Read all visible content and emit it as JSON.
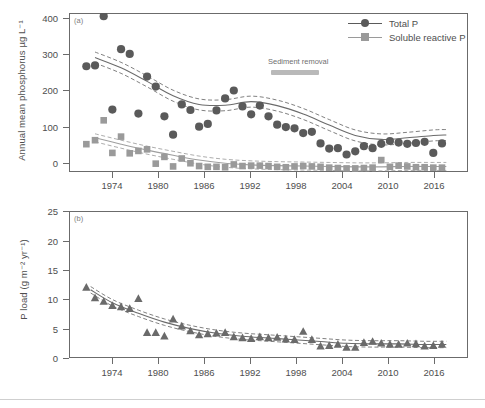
{
  "figure": {
    "background": "#ffffff",
    "total_p_color": "#5a5a5a",
    "srp_color": "#9a9a9a",
    "pload_color": "#6a6a6a",
    "axis_color": "#6b6b6b",
    "sediment_bar_color": "#b9b9b9"
  },
  "panel_a": {
    "tag": "(a)",
    "ylabel": "Annual mean phosphorus µg L⁻¹",
    "yticks": [
      "0",
      "100",
      "200",
      "300",
      "400"
    ],
    "xticks": [
      "1974",
      "1980",
      "1986",
      "1992",
      "1998",
      "2004",
      "2010",
      "2016"
    ],
    "legend": [
      {
        "label": "Total P",
        "marker": "circle",
        "color": "#5a5a5a"
      },
      {
        "label": "Soluble reactive P",
        "marker": "square",
        "color": "#9a9a9a"
      }
    ],
    "annotation": {
      "label": "Sediment removal",
      "start_year": 1994.3,
      "end_year": 1998.6
    }
  },
  "panel_b": {
    "tag": "(b)",
    "ylabel": "P load (g m⁻² yr⁻¹)",
    "yticks": [
      "0",
      "5",
      "10",
      "15",
      "20",
      "25"
    ],
    "xticks": [
      "1974",
      "1980",
      "1986",
      "1992",
      "1998",
      "2004",
      "2010",
      "2016"
    ]
  },
  "chart_data": [
    {
      "type": "scatter",
      "panel": "(a)",
      "title": "",
      "xlabel": "",
      "ylabel": "Annual mean phosphorus µg L⁻¹",
      "xlim": [
        1972,
        2018
      ],
      "ylim": [
        0,
        400
      ],
      "xticks": [
        1974,
        1980,
        1986,
        1992,
        1998,
        2004,
        2010,
        2016
      ],
      "yticks": [
        0,
        100,
        200,
        300,
        400
      ],
      "grid": false,
      "legend_position": "top-right",
      "annotations": [
        {
          "text": "Sediment removal",
          "x_range": [
            1994.3,
            1998.6
          ],
          "y": 265,
          "style": "gray-bar"
        }
      ],
      "series": [
        {
          "name": "Total P",
          "marker": "circle",
          "color": "#5a5a5a",
          "x": [
            1974,
            1975,
            1976,
            1977,
            1978,
            1979,
            1980,
            1981,
            1982,
            1983,
            1984,
            1985,
            1986,
            1987,
            1988,
            1989,
            1990,
            1991,
            1992,
            1993,
            1994,
            1995,
            1996,
            1997,
            1998,
            1999,
            2000,
            2001,
            2002,
            2003,
            2004,
            2005,
            2006,
            2007,
            2008,
            2009,
            2010,
            2011,
            2012,
            2013,
            2014,
            2015
          ],
          "y": [
            266,
            268,
            392,
            157,
            309,
            297,
            147,
            240,
            215,
            140,
            94,
            170,
            156,
            114,
            121,
            155,
            185,
            205,
            165,
            145,
            167,
            140,
            119,
            113,
            110,
            98,
            101,
            72,
            59,
            60,
            44,
            52,
            65,
            60,
            71,
            78,
            74,
            71,
            73,
            76,
            48,
            72
          ]
        },
        {
          "name": "Soluble reactive P",
          "marker": "square",
          "color": "#9a9a9a",
          "x": [
            1974,
            1975,
            1976,
            1977,
            1978,
            1979,
            1980,
            1981,
            1982,
            1983,
            1984,
            1985,
            1986,
            1987,
            1988,
            1989,
            1990,
            1991,
            1992,
            1993,
            1994,
            1995,
            1996,
            1997,
            1998,
            1999,
            2000,
            2001,
            2002,
            2003,
            2004,
            2005,
            2006,
            2007,
            2008,
            2009,
            2010,
            2011,
            2012,
            2013,
            2014,
            2015
          ],
          "y": [
            70,
            80,
            130,
            48,
            89,
            47,
            53,
            57,
            21,
            38,
            14,
            34,
            22,
            15,
            13,
            13,
            12,
            19,
            15,
            16,
            16,
            15,
            13,
            12,
            14,
            15,
            14,
            13,
            11,
            10,
            9,
            9,
            10,
            11,
            30,
            13,
            16,
            14,
            12,
            12,
            11,
            11
          ]
        }
      ],
      "fitted_curve": {
        "name": "Total P trend (with 95% confidence band)",
        "x": [
          1975,
          1978,
          1981,
          1984,
          1987,
          1990,
          1993,
          1996,
          1999,
          2002,
          2005,
          2008,
          2011,
          2014,
          2015.5
        ],
        "y": [
          288,
          262,
          228,
          192,
          170,
          168,
          177,
          167,
          146,
          118,
          92,
          82,
          86,
          92,
          93
        ]
      },
      "fitted_curve_srp": {
        "name": "Soluble reactive P trend (with 95% confidence band)",
        "x": [
          1975,
          1978,
          1981,
          1984,
          1987,
          1990,
          1993,
          1996,
          1999,
          2002,
          2005,
          2008,
          2011,
          2014,
          2015.5
        ],
        "y": [
          86,
          70,
          55,
          42,
          30,
          22,
          18,
          16,
          15,
          14,
          13,
          13,
          14,
          14,
          14
        ]
      }
    },
    {
      "type": "scatter",
      "panel": "(b)",
      "title": "",
      "xlabel": "",
      "ylabel": "P load (g m⁻² yr⁻¹)",
      "xlim": [
        1972,
        2018
      ],
      "ylim": [
        0,
        25
      ],
      "xticks": [
        1974,
        1980,
        1986,
        1992,
        1998,
        2004,
        2010,
        2016
      ],
      "yticks": [
        0,
        5,
        10,
        15,
        20,
        25
      ],
      "grid": false,
      "legend_position": "none",
      "series": [
        {
          "name": "P load",
          "marker": "triangle",
          "color": "#6a6a6a",
          "x": [
            1974,
            1975,
            1976,
            1977,
            1978,
            1979,
            1980,
            1981,
            1982,
            1983,
            1984,
            1985,
            1986,
            1987,
            1988,
            1989,
            1990,
            1991,
            1992,
            1993,
            1994,
            1995,
            1996,
            1997,
            1998,
            1999,
            2000,
            2001,
            2002,
            2003,
            2004,
            2005,
            2006,
            2007,
            2008,
            2009,
            2010,
            2011,
            2012,
            2013,
            2014,
            2015
          ],
          "y": [
            12.0,
            10.2,
            9.6,
            8.9,
            8.7,
            8.4,
            10.1,
            4.3,
            4.3,
            3.7,
            6.6,
            5.4,
            4.6,
            3.9,
            4.1,
            4.2,
            4.3,
            3.6,
            3.4,
            3.3,
            3.6,
            3.4,
            3.5,
            3.2,
            3.1,
            4.5,
            3.1,
            2.0,
            2.1,
            2.3,
            1.8,
            1.8,
            2.6,
            2.8,
            2.5,
            2.3,
            2.3,
            2.5,
            2.4,
            2.0,
            2.1,
            2.3
          ]
        }
      ],
      "fitted_curve": {
        "name": "P load trend (with 95% confidence band)",
        "x": [
          1974.5,
          1977,
          1980,
          1983,
          1986,
          1989,
          1992,
          1995,
          1998,
          2001,
          2004,
          2007,
          2010,
          2013,
          2015.5
        ],
        "y": [
          11.6,
          9.4,
          7.6,
          6.1,
          5.0,
          4.2,
          3.7,
          3.4,
          3.1,
          2.8,
          2.5,
          2.4,
          2.4,
          2.3,
          2.3
        ]
      }
    }
  ]
}
